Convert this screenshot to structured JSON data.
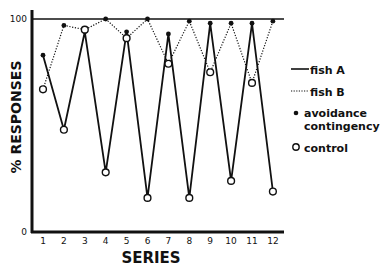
{
  "chart_data": {
    "type": "line",
    "title": "",
    "xlabel": "SERIES",
    "ylabel": "% RESPONSES",
    "x": [
      1,
      2,
      3,
      4,
      5,
      6,
      7,
      8,
      9,
      10,
      11,
      12
    ],
    "xticks": [
      "1",
      "2",
      "3",
      "4",
      "5",
      "6",
      "7",
      "8",
      "9",
      "10",
      "11",
      "12"
    ],
    "yticks": [
      "0",
      "100"
    ],
    "ylim": [
      0,
      100
    ],
    "grid": false,
    "reference_line": 100,
    "legend_position": "right",
    "series": [
      {
        "name": "fish A",
        "line_style": "solid",
        "values": [
          83,
          48,
          94,
          28,
          94,
          16,
          93,
          16,
          98,
          24,
          98,
          19
        ],
        "conditions": [
          "avoidance",
          "control",
          "avoidance",
          "control",
          "avoidance",
          "control",
          "avoidance",
          "control",
          "avoidance",
          "control",
          "avoidance",
          "control"
        ]
      },
      {
        "name": "fish B",
        "line_style": "dotted",
        "values": [
          67,
          97,
          95,
          100,
          91,
          100,
          79,
          99,
          75,
          98,
          70,
          99
        ],
        "conditions": [
          "control",
          "avoidance",
          "control",
          "avoidance",
          "control",
          "avoidance",
          "control",
          "avoidance",
          "control",
          "avoidance",
          "control",
          "avoidance"
        ]
      }
    ],
    "legend": [
      {
        "label": "fish A",
        "symbol": "solid-line"
      },
      {
        "label": "fish B",
        "symbol": "dotted-line"
      },
      {
        "label": "avoidance",
        "label2": "contingency",
        "symbol": "filled-circle"
      },
      {
        "label": "control",
        "symbol": "open-circle"
      }
    ]
  }
}
